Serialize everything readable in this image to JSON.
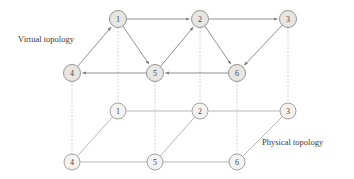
{
  "figure": {
    "width": 354,
    "height": 179,
    "background": "#ffffff"
  },
  "labels": {
    "virtual": "Virtual topology",
    "physical": "Physical topology"
  },
  "colors": {
    "node_fill_virtual": "#e8e6e2",
    "node_fill_physical": "#f4f3f1",
    "node_stroke": "#8d8a86",
    "edge_virtual": "#7f7c78",
    "edge_physical": "#a8a5a1",
    "edge_link": "#b9b6b2",
    "text": "#3c3835"
  },
  "nodes": {
    "virtual": [
      {
        "id": "v1",
        "label": "1",
        "x": 118,
        "y": 19
      },
      {
        "id": "v2",
        "label": "2",
        "x": 200,
        "y": 19
      },
      {
        "id": "v3",
        "label": "3",
        "x": 288,
        "y": 19
      },
      {
        "id": "v4",
        "label": "4",
        "x": 72,
        "y": 73
      },
      {
        "id": "v5",
        "label": "5",
        "x": 155,
        "y": 73
      },
      {
        "id": "v6",
        "label": "6",
        "x": 237,
        "y": 73
      }
    ],
    "physical": [
      {
        "id": "p1",
        "label": "1",
        "x": 118,
        "y": 111
      },
      {
        "id": "p2",
        "label": "2",
        "x": 200,
        "y": 111
      },
      {
        "id": "p3",
        "label": "3",
        "x": 288,
        "y": 111
      },
      {
        "id": "p4",
        "label": "4",
        "x": 72,
        "y": 162
      },
      {
        "id": "p5",
        "label": "5",
        "x": 155,
        "y": 162
      },
      {
        "id": "p6",
        "label": "6",
        "x": 237,
        "y": 162
      }
    ],
    "radius_virtual": 8.5,
    "radius_physical": 8.0
  },
  "edges": {
    "virtual_directed": [
      {
        "from": "v1",
        "to": "v2"
      },
      {
        "from": "v2",
        "to": "v3"
      },
      {
        "from": "v1",
        "to": "v5"
      },
      {
        "from": "v4",
        "to": "v1"
      },
      {
        "from": "v5",
        "to": "v2"
      },
      {
        "from": "v2",
        "to": "v6"
      },
      {
        "from": "v3",
        "to": "v6"
      },
      {
        "from": "v5",
        "to": "v4"
      },
      {
        "from": "v6",
        "to": "v5"
      }
    ],
    "physical_undirected": [
      {
        "from": "p1",
        "to": "p2"
      },
      {
        "from": "p2",
        "to": "p3"
      },
      {
        "from": "p4",
        "to": "p5"
      },
      {
        "from": "p5",
        "to": "p6"
      },
      {
        "from": "p4",
        "to": "p1"
      },
      {
        "from": "p5",
        "to": "p2"
      },
      {
        "from": "p6",
        "to": "p3"
      }
    ],
    "layer_links": [
      {
        "from": "v1",
        "to": "p1"
      },
      {
        "from": "v2",
        "to": "p2"
      },
      {
        "from": "v3",
        "to": "p3"
      },
      {
        "from": "v4",
        "to": "p4"
      },
      {
        "from": "v5",
        "to": "p5"
      },
      {
        "from": "v6",
        "to": "p6"
      }
    ]
  },
  "caption_positions": {
    "virtual": {
      "x": 18,
      "y": 42
    },
    "physical": {
      "x": 262,
      "y": 145
    }
  }
}
